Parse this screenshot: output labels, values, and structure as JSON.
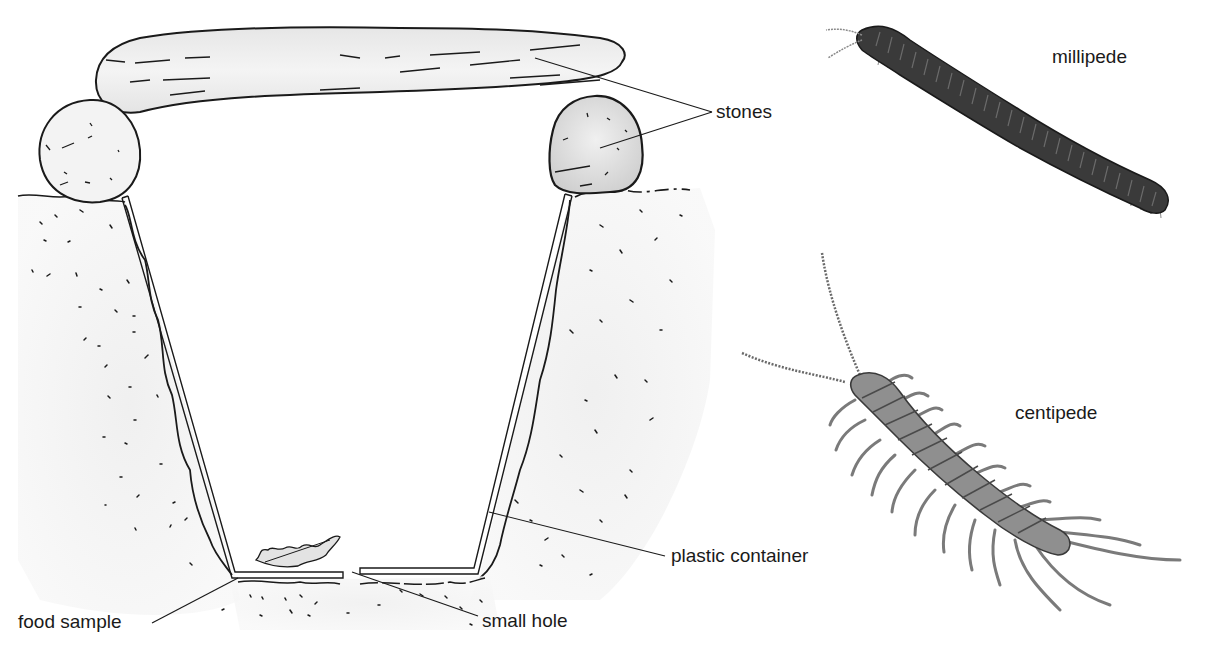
{
  "diagram": {
    "type": "pitfall-trap-illustration",
    "labels": {
      "stones": "stones",
      "plastic_container": "plastic container",
      "food_sample": "food sample",
      "small_hole": "small hole",
      "millipede": "millipede",
      "centipede": "centipede"
    },
    "parts": [
      "top stone slab",
      "left support stone",
      "right support stone",
      "soil",
      "plastic container",
      "food sample",
      "small hole"
    ],
    "organisms": [
      "millipede",
      "centipede"
    ],
    "colors": {
      "ink": "#1a1a1a",
      "stone_fill": "#ececec",
      "soil_fill": "#f2f2f2",
      "millipede_body": "#3a3a3a",
      "centipede_body": "#8a8a8a"
    }
  }
}
